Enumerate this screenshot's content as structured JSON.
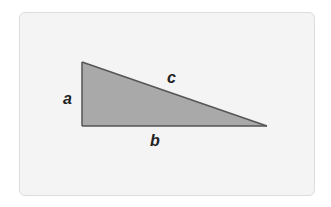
{
  "diagram": {
    "type": "right-triangle",
    "labels": {
      "a": "a",
      "b": "b",
      "c": "c"
    },
    "sides": {
      "a": "vertical leg",
      "b": "horizontal leg (base)",
      "c": "hypotenuse"
    },
    "vertices": {
      "top": [
        82,
        62
      ],
      "right_angle": [
        82,
        126
      ],
      "right": [
        267,
        126
      ]
    },
    "colors": {
      "card_background": "#f4f4f4",
      "card_border": "#dcdcdc",
      "triangle_fill": "#a9a9a9",
      "triangle_stroke": "#555555",
      "label_color": "#222222"
    }
  }
}
